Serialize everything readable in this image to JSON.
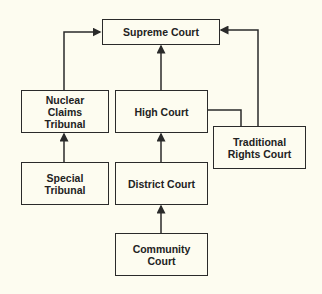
{
  "diagram": {
    "type": "hierarchy",
    "background": "#fdfcf0",
    "line_color": "#2a2a2a",
    "nodes": {
      "supreme": "Supreme Court",
      "nuclear": "Nuclear Claims Tribunal",
      "high": "High Court",
      "traditional": "Traditional Rights Court",
      "special": "Special Tribunal",
      "district": "District Court",
      "community": "Community Court"
    },
    "edges": [
      {
        "from": "Nuclear Claims Tribunal",
        "to": "Supreme Court"
      },
      {
        "from": "High Court",
        "to": "Supreme Court"
      },
      {
        "from": "Traditional Rights Court",
        "to": "Supreme Court"
      },
      {
        "from": "High Court",
        "to": "Traditional Rights Court",
        "style": "line"
      },
      {
        "from": "Special Tribunal",
        "to": "Nuclear Claims Tribunal"
      },
      {
        "from": "District Court",
        "to": "High Court"
      },
      {
        "from": "Community Court",
        "to": "District Court"
      }
    ]
  }
}
